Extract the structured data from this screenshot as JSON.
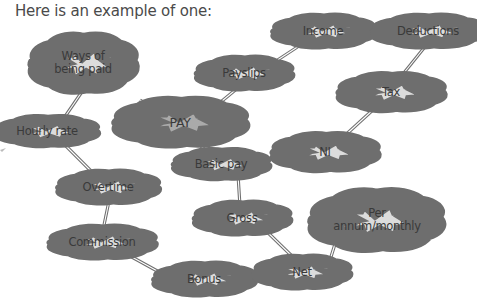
{
  "heading": "Here is an example of one:",
  "colors": {
    "cloud_fill": "#dcdcdc",
    "center_fill": "#aaaaaa",
    "cloud_stroke": "#6e6e6e",
    "connector": "#6e6e6e",
    "text": "#3a3a3a"
  },
  "nodes": {
    "pay": "PAY",
    "ways_of_being_paid": "Ways of being paid",
    "hourly_rate": "Hourly rate",
    "overtime": "Overtime",
    "commission": "Commission",
    "bonus": "Bonus",
    "payslips": "Payslips",
    "income": "Income",
    "deductions": "Deductions",
    "tax": "Tax",
    "ni": "NI",
    "basic_pay": "Basic pay",
    "gross": "Gross",
    "net": "Net",
    "per_annum_monthly": "Per annum/monthly"
  },
  "edges": [
    [
      "pay",
      "ways_of_being_paid"
    ],
    [
      "ways_of_being_paid",
      "hourly_rate"
    ],
    [
      "hourly_rate",
      "overtime"
    ],
    [
      "overtime",
      "commission"
    ],
    [
      "commission",
      "bonus"
    ],
    [
      "pay",
      "payslips"
    ],
    [
      "payslips",
      "income"
    ],
    [
      "income",
      "deductions"
    ],
    [
      "deductions",
      "tax"
    ],
    [
      "tax",
      "ni"
    ],
    [
      "pay",
      "basic_pay"
    ],
    [
      "basic_pay",
      "gross"
    ],
    [
      "gross",
      "net"
    ],
    [
      "net",
      "per_annum_monthly"
    ]
  ]
}
